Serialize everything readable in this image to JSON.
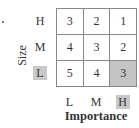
{
  "chart_data": {
    "type": "heatmap",
    "title": "",
    "xlabel": "Importance",
    "ylabel": "Size",
    "x_categories": [
      "L",
      "M",
      "H"
    ],
    "y_categories": [
      "H",
      "M",
      "L"
    ],
    "values": [
      [
        3,
        2,
        1
      ],
      [
        4,
        3,
        2
      ],
      [
        5,
        4,
        3
      ]
    ],
    "highlighted": {
      "row": "L",
      "column": "H",
      "value": 3
    },
    "colors": {
      "highlight": "#c4c4c4",
      "cell": "#ffffff",
      "border": "#888888"
    }
  }
}
